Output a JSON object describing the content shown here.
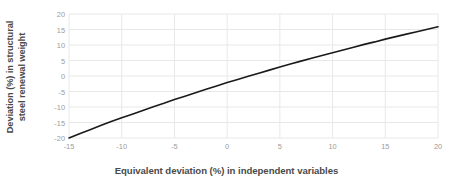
{
  "chart_data": {
    "type": "line",
    "title": "",
    "xlabel": "Equivalent deviation (%) in independent variables",
    "ylabel": "Deviation (%) in structural steel renewal weight",
    "ylabel_line1": "Deviation (%) in structural",
    "ylabel_line2": "steel renewal weight",
    "xlim": [
      -15,
      20
    ],
    "ylim": [
      -20,
      20
    ],
    "xticks": [
      -15,
      -10,
      -5,
      0,
      5,
      10,
      15,
      20
    ],
    "yticks": [
      20,
      15,
      10,
      5,
      0,
      -5,
      -10,
      -15,
      -20
    ],
    "xtick_labels": [
      "-15",
      "-10",
      "-5",
      "0",
      "5",
      "10",
      "15",
      "20"
    ],
    "ytick_labels": [
      "20",
      "15",
      "10",
      "5",
      "0",
      "-5",
      "-10",
      "-15",
      "-20"
    ],
    "grid": true,
    "grid_color": "#e8e8e8",
    "legend": false,
    "legend_position": "none",
    "series": [
      {
        "name": "Deviation in structural steel renewal weight",
        "color": "#1a1a1a",
        "line_width": 1.6,
        "x": [
          -15,
          -14,
          -13,
          -12,
          -11,
          -10,
          -9,
          -8,
          -7,
          -6,
          -5,
          -4,
          -3,
          -2,
          -1,
          0,
          1,
          2,
          3,
          4,
          5,
          6,
          7,
          8,
          9,
          10,
          11,
          12,
          13,
          14,
          15,
          16,
          17,
          18,
          19,
          20
        ],
        "y": [
          -20.0,
          -18.6,
          -17.3,
          -16.0,
          -14.7,
          -13.5,
          -12.3,
          -11.1,
          -9.9,
          -8.8,
          -7.6,
          -6.5,
          -5.4,
          -4.3,
          -3.2,
          -2.1,
          -1.1,
          -0.1,
          0.9,
          1.9,
          2.9,
          3.9,
          4.8,
          5.7,
          6.6,
          7.5,
          8.4,
          9.3,
          10.2,
          11.0,
          11.9,
          12.7,
          13.5,
          14.3,
          15.1,
          15.9
        ]
      }
    ]
  },
  "axes": {
    "y_title_line1": "Deviation (%) in structural",
    "y_title_line2": "steel renewal weight",
    "x_title": "Equivalent deviation (%) in independent variables"
  },
  "colors": {
    "curve": "#1a1a1a",
    "grid": "#e8e8e8",
    "axis_text": "#9b9b9b",
    "title_text": "#4a4a4a",
    "background": "#ffffff"
  }
}
